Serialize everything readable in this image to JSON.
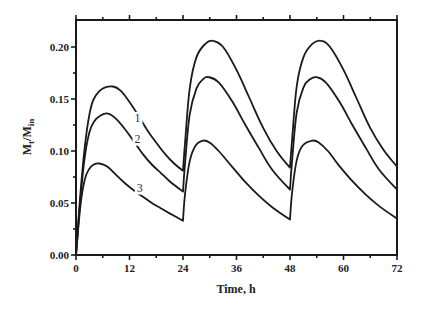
{
  "chart_data": {
    "type": "line",
    "title": "",
    "xlabel": "Time, h",
    "ylabel_main": "M",
    "ylabel_sub1": "t",
    "ylabel_sep": "/M",
    "ylabel_sub2": "in",
    "ylabel": "Mt/Min",
    "xlim": [
      0,
      72
    ],
    "ylim": [
      0,
      0.226
    ],
    "x_ticks": [
      0,
      12,
      24,
      36,
      48,
      60,
      72
    ],
    "x_tick_labels": [
      "0",
      "12",
      "24",
      "36",
      "48",
      "60",
      "72"
    ],
    "x_minor_ticks": [
      6,
      18,
      30,
      42,
      54,
      66
    ],
    "y_ticks": [
      0,
      0.05,
      0.1,
      0.15,
      0.2
    ],
    "y_tick_labels": [
      "0.00",
      "0.05",
      "0.10",
      "0.15",
      "0.20"
    ],
    "y_minor_ticks": [
      0.025,
      0.075,
      0.125,
      0.175
    ],
    "grid": false,
    "legend": "inline numeric labels on curves",
    "series": [
      {
        "name": "1",
        "label_pos": [
          13.8,
          0.128
        ],
        "points": [
          [
            0,
            0
          ],
          [
            1,
            0.06
          ],
          [
            2,
            0.105
          ],
          [
            3,
            0.135
          ],
          [
            4,
            0.15
          ],
          [
            6,
            0.16
          ],
          [
            8.3,
            0.162
          ],
          [
            10,
            0.158
          ],
          [
            12,
            0.147
          ],
          [
            14,
            0.134
          ],
          [
            16,
            0.12
          ],
          [
            18,
            0.108
          ],
          [
            20,
            0.097
          ],
          [
            22,
            0.088
          ],
          [
            24,
            0.081
          ],
          [
            24.5,
            0.11
          ],
          [
            25.5,
            0.16
          ],
          [
            27,
            0.19
          ],
          [
            29,
            0.203
          ],
          [
            30.7,
            0.206
          ],
          [
            33,
            0.2
          ],
          [
            36,
            0.178
          ],
          [
            39,
            0.15
          ],
          [
            42,
            0.122
          ],
          [
            45,
            0.1
          ],
          [
            48,
            0.084
          ],
          [
            48.5,
            0.112
          ],
          [
            49.5,
            0.162
          ],
          [
            51,
            0.19
          ],
          [
            53,
            0.203
          ],
          [
            55,
            0.206
          ],
          [
            57,
            0.2
          ],
          [
            60,
            0.178
          ],
          [
            63,
            0.15
          ],
          [
            66,
            0.122
          ],
          [
            69,
            0.101
          ],
          [
            72,
            0.085
          ]
        ]
      },
      {
        "name": "2",
        "label_pos": [
          13.8,
          0.108
        ],
        "points": [
          [
            0,
            0
          ],
          [
            1,
            0.055
          ],
          [
            2,
            0.095
          ],
          [
            3,
            0.118
          ],
          [
            4,
            0.128
          ],
          [
            5.5,
            0.134
          ],
          [
            7.2,
            0.136
          ],
          [
            9,
            0.131
          ],
          [
            11,
            0.121
          ],
          [
            13,
            0.109
          ],
          [
            15,
            0.097
          ],
          [
            17,
            0.087
          ],
          [
            19,
            0.079
          ],
          [
            21,
            0.071
          ],
          [
            24,
            0.061
          ],
          [
            24.5,
            0.09
          ],
          [
            25.5,
            0.135
          ],
          [
            27,
            0.16
          ],
          [
            28.5,
            0.169
          ],
          [
            29.8,
            0.171
          ],
          [
            32,
            0.166
          ],
          [
            35,
            0.148
          ],
          [
            38,
            0.125
          ],
          [
            41,
            0.103
          ],
          [
            44,
            0.082
          ],
          [
            48,
            0.063
          ],
          [
            48.5,
            0.092
          ],
          [
            49.5,
            0.137
          ],
          [
            51,
            0.161
          ],
          [
            52.5,
            0.169
          ],
          [
            54,
            0.171
          ],
          [
            56,
            0.166
          ],
          [
            59,
            0.148
          ],
          [
            62,
            0.125
          ],
          [
            65,
            0.103
          ],
          [
            68,
            0.082
          ],
          [
            72,
            0.063
          ]
        ]
      },
      {
        "name": "3",
        "label_pos": [
          14.3,
          0.061
        ],
        "points": [
          [
            0,
            0
          ],
          [
            1,
            0.048
          ],
          [
            2,
            0.073
          ],
          [
            3,
            0.083
          ],
          [
            4,
            0.087
          ],
          [
            5.2,
            0.088
          ],
          [
            7,
            0.085
          ],
          [
            9,
            0.077
          ],
          [
            11,
            0.069
          ],
          [
            13,
            0.062
          ],
          [
            15,
            0.056
          ],
          [
            17,
            0.05
          ],
          [
            19,
            0.045
          ],
          [
            21,
            0.04
          ],
          [
            24,
            0.033
          ],
          [
            24.5,
            0.06
          ],
          [
            25.5,
            0.09
          ],
          [
            26.8,
            0.105
          ],
          [
            28.5,
            0.11
          ],
          [
            30,
            0.108
          ],
          [
            32,
            0.1
          ],
          [
            35,
            0.085
          ],
          [
            38,
            0.07
          ],
          [
            41,
            0.057
          ],
          [
            44,
            0.046
          ],
          [
            48,
            0.034
          ],
          [
            48.5,
            0.061
          ],
          [
            49.5,
            0.091
          ],
          [
            50.8,
            0.105
          ],
          [
            53,
            0.11
          ],
          [
            54.5,
            0.108
          ],
          [
            56.5,
            0.1
          ],
          [
            59,
            0.086
          ],
          [
            62,
            0.071
          ],
          [
            65,
            0.058
          ],
          [
            68,
            0.047
          ],
          [
            72,
            0.035
          ]
        ]
      }
    ]
  }
}
